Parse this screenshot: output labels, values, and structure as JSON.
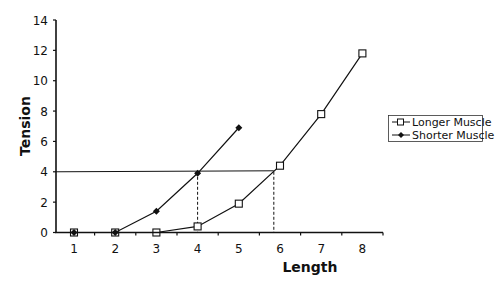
{
  "chart_data": {
    "type": "line",
    "title": "",
    "xlabel": "Length",
    "ylabel": "Tension",
    "categories": [
      1,
      2,
      3,
      4,
      5,
      6,
      7,
      8
    ],
    "ylim": [
      0,
      14
    ],
    "yticks": [
      0,
      2,
      4,
      6,
      8,
      10,
      12,
      14
    ],
    "grid": false,
    "legend_position": "right",
    "series": [
      {
        "name": "Longer Muscle",
        "marker": "open-square",
        "x": [
          1,
          2,
          3,
          4,
          5,
          6,
          7,
          8
        ],
        "values": [
          0,
          0,
          0,
          0.4,
          1.9,
          4.4,
          7.8,
          11.8
        ]
      },
      {
        "name": "Shorter Muscle",
        "marker": "filled-diamond",
        "x": [
          1,
          2,
          3,
          4,
          5
        ],
        "values": [
          0,
          0,
          1.4,
          3.9,
          6.9
        ]
      }
    ],
    "annotations": [
      {
        "type": "horizontal-line",
        "y": 4,
        "x_from": 0.55,
        "x_to": 5.85
      },
      {
        "type": "dashed-vertical-line",
        "x": 4,
        "y_from": 0,
        "y_to": 4
      },
      {
        "type": "dashed-vertical-line",
        "x": 5.85,
        "y_from": 0,
        "y_to": 4
      }
    ]
  },
  "axes": {
    "xlabel": "Length",
    "ylabel": "Tension",
    "xticks": [
      "1",
      "2",
      "3",
      "4",
      "5",
      "6",
      "7",
      "8"
    ],
    "yticks": [
      "0",
      "2",
      "4",
      "6",
      "8",
      "10",
      "12",
      "14"
    ]
  },
  "legend": {
    "items": [
      {
        "label": "Longer Muscle"
      },
      {
        "label": "Shorter Muscle"
      }
    ]
  }
}
